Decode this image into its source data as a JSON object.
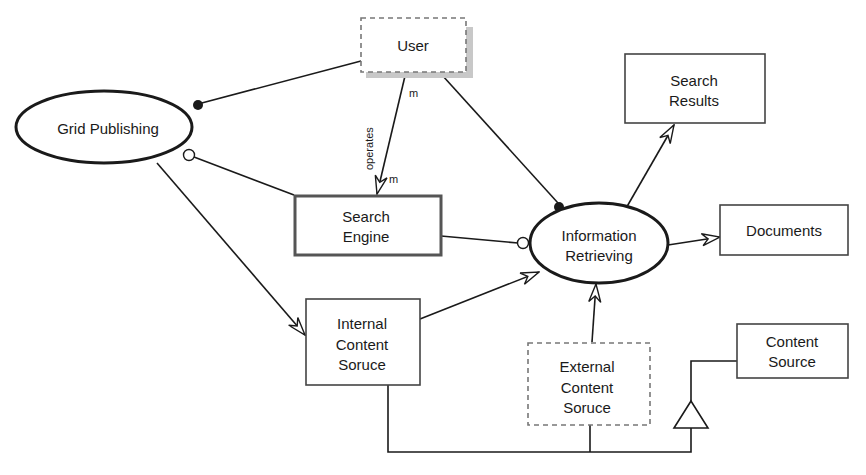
{
  "diagram": {
    "type": "conceptual-model",
    "nodes": {
      "user": {
        "label": "User",
        "shape": "dashed-rectangle-with-shadow"
      },
      "grid_publishing": {
        "label": "Grid Publishing",
        "shape": "ellipse"
      },
      "search_engine": {
        "label_line1": "Search",
        "label_line2": "Engine",
        "shape": "thick-rectangle"
      },
      "information_retrieving": {
        "label_line1": "Information",
        "label_line2": "Retrieving",
        "shape": "ellipse"
      },
      "search_results": {
        "label_line1": "Search",
        "label_line2": "Results",
        "shape": "rectangle"
      },
      "documents": {
        "label": "Documents",
        "shape": "rectangle"
      },
      "internal_content_source": {
        "label_line1": "Internal",
        "label_line2": "Content",
        "label_line3": "Soruce",
        "shape": "rectangle"
      },
      "external_content_source": {
        "label_line1": "External",
        "label_line2": "Content",
        "label_line3": "Soruce",
        "shape": "dashed-rectangle"
      },
      "content_source": {
        "label_line1": "Content",
        "label_line2": "Source",
        "shape": "rectangle"
      }
    },
    "edges": [
      {
        "from": "User",
        "to": "Grid Publishing",
        "end": "filled-dot"
      },
      {
        "from": "User",
        "to": "Search Engine",
        "label": "operates",
        "source_multiplicity": "m",
        "target_multiplicity": "m",
        "end": "open-arrow"
      },
      {
        "from": "User",
        "to": "Information Retrieving",
        "end": "filled-dot"
      },
      {
        "from": "Search Engine",
        "to": "Grid Publishing",
        "end": "hollow-dot"
      },
      {
        "from": "Search Engine",
        "to": "Information Retrieving",
        "end": "hollow-dot"
      },
      {
        "from": "Grid Publishing",
        "to": "Internal Content Soruce",
        "end": "open-arrow"
      },
      {
        "from": "Internal Content Soruce",
        "to": "Information Retrieving",
        "end": "open-arrow"
      },
      {
        "from": "External Content Soruce",
        "to": "Information Retrieving",
        "end": "open-arrow"
      },
      {
        "from": "Information Retrieving",
        "to": "Search Results",
        "end": "open-arrow"
      },
      {
        "from": "Information Retrieving",
        "to": "Documents",
        "end": "open-arrow"
      },
      {
        "from": "Internal Content Soruce",
        "to": "Content Source",
        "end": "generalization-triangle"
      },
      {
        "from": "External Content Soruce",
        "to": "Content Source",
        "end": "generalization-triangle"
      }
    ],
    "edge_labels": {
      "operates": "operates",
      "mult_source": "m",
      "mult_target": "m"
    },
    "colors": {
      "stroke": "#1a1a1a",
      "thick_border": "#555555",
      "dash": "#777777",
      "shadow": "#c8c8c8",
      "background": "#ffffff"
    }
  }
}
